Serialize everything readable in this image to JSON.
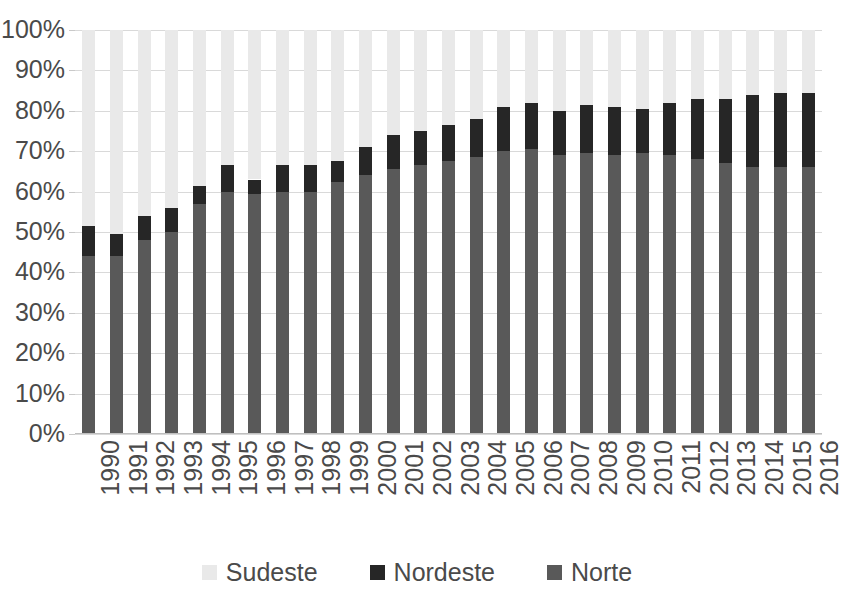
{
  "chart_data": {
    "type": "bar",
    "stacked": true,
    "stack_total": 100,
    "title": "",
    "subtitle": "",
    "xlabel": "",
    "ylabel": "",
    "ylim": [
      0,
      100
    ],
    "ytick_labels": [
      "100%",
      "90%",
      "80%",
      "70%",
      "60%",
      "50%",
      "40%",
      "30%",
      "20%",
      "10%",
      "0%"
    ],
    "ytick_values": [
      100,
      90,
      80,
      70,
      60,
      50,
      40,
      30,
      20,
      10,
      0
    ],
    "grid": true,
    "legend_position": "bottom",
    "categories": [
      "1990",
      "1991",
      "1992",
      "1993",
      "1994",
      "1995",
      "1996",
      "1997",
      "1998",
      "1999",
      "2000",
      "2001",
      "2002",
      "2003",
      "2004",
      "2005",
      "2006",
      "2007",
      "2008",
      "2009",
      "2010",
      "2011",
      "2012",
      "2013",
      "2014",
      "2015",
      "2016"
    ],
    "series": [
      {
        "name": "Norte",
        "color": "#595959",
        "stack_order": 1,
        "values": [
          44.0,
          44.0,
          48.0,
          50.0,
          57.0,
          60.0,
          59.5,
          60.0,
          60.0,
          62.5,
          64.0,
          65.5,
          66.5,
          67.5,
          68.5,
          70.0,
          70.5,
          69.0,
          69.5,
          69.0,
          69.5,
          69.0,
          68.0,
          67.0,
          66.0,
          66.0,
          66.0
        ]
      },
      {
        "name": "Nordeste",
        "color": "#262626",
        "stack_order": 2,
        "values": [
          7.5,
          5.5,
          6.0,
          6.0,
          4.5,
          6.5,
          3.5,
          6.5,
          6.5,
          5.0,
          7.0,
          8.5,
          8.5,
          9.0,
          9.5,
          11.0,
          11.5,
          11.0,
          12.0,
          12.0,
          11.0,
          13.0,
          15.0,
          16.0,
          18.0,
          18.5,
          18.5
        ]
      },
      {
        "name": "Sudeste",
        "color": "#e9e9e9",
        "stack_order": 3,
        "values": [
          48.5,
          50.5,
          46.0,
          44.0,
          38.5,
          33.5,
          37.0,
          33.5,
          33.5,
          32.5,
          29.0,
          26.0,
          25.0,
          23.5,
          22.0,
          19.0,
          18.0,
          20.0,
          18.5,
          19.0,
          19.5,
          18.0,
          17.0,
          17.0,
          16.0,
          15.5,
          15.5
        ]
      }
    ],
    "cumulative_norte_plus_nordeste": [
      51.5,
      49.5,
      54.0,
      56.0,
      61.5,
      66.5,
      63.0,
      66.5,
      66.5,
      67.5,
      71.0,
      74.0,
      75.0,
      76.5,
      78.0,
      81.0,
      82.0,
      80.0,
      81.5,
      81.0,
      80.5,
      82.0,
      83.0,
      83.0,
      84.0,
      84.5,
      84.5
    ]
  },
  "legend": {
    "items": [
      {
        "label": "Sudeste",
        "color": "#e9e9e9"
      },
      {
        "label": "Nordeste",
        "color": "#262626"
      },
      {
        "label": "Norte",
        "color": "#595959"
      }
    ]
  },
  "colors": {
    "gridline": "#d9d9d9",
    "axis": "#bfbfbf",
    "text": "#4a4a4a",
    "background": "#ffffff"
  }
}
